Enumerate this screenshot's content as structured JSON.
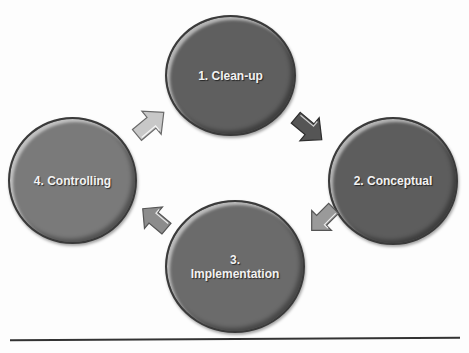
{
  "diagram": {
    "type": "cycle",
    "nodes": [
      {
        "id": 1,
        "label": "1. Clean-up",
        "color": "#5f5f5f"
      },
      {
        "id": 2,
        "label": "2. Conceptual",
        "color": "#5d5d5d"
      },
      {
        "id": 3,
        "label": "3.\nImplementation",
        "color": "#6b6b6b"
      },
      {
        "id": 4,
        "label": "4. Controlling",
        "color": "#7a7a7a"
      }
    ],
    "arrows": [
      {
        "from": 1,
        "to": 2,
        "icon": "arrow-down-right-icon",
        "color": "#555555"
      },
      {
        "from": 2,
        "to": 3,
        "icon": "arrow-down-left-icon",
        "color": "#9a9a9a"
      },
      {
        "from": 3,
        "to": 4,
        "icon": "arrow-up-left-icon",
        "color": "#8c8c8c"
      },
      {
        "from": 4,
        "to": 1,
        "icon": "arrow-up-right-icon",
        "color": "#c4c4c4"
      }
    ]
  }
}
